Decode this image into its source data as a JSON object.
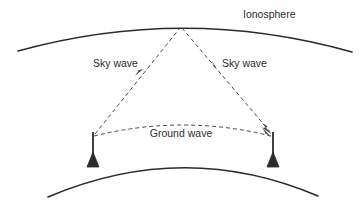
{
  "diagram": {
    "background_color": "#ffffff",
    "line_color": "#2b2b2b",
    "dashed_color": "#4a4a4a",
    "labels": {
      "ionosphere": "Ionosphere",
      "sky_wave_left": "Sky wave",
      "sky_wave_right": "Sky wave",
      "ground_wave": "Ground wave"
    },
    "elements": {
      "ionosphere_layer": "ionosphere-arc",
      "earth_surface": "earth-arc",
      "transmitter_tower": "antenna-tower-left",
      "receiver_tower": "antenna-tower-right",
      "sky_wave_up_path": "sky-wave-ascending-ray",
      "sky_wave_down_path": "sky-wave-descending-ray",
      "ground_wave_path": "ground-wave-arc"
    },
    "geometry": {
      "width": 360,
      "height": 207,
      "reflection_point": [
        181,
        27
      ],
      "tower_left_base": [
        93,
        166
      ],
      "tower_left_top": [
        93,
        134
      ],
      "tower_right_base": [
        273,
        166
      ],
      "tower_right_top": [
        273,
        134
      ]
    }
  }
}
